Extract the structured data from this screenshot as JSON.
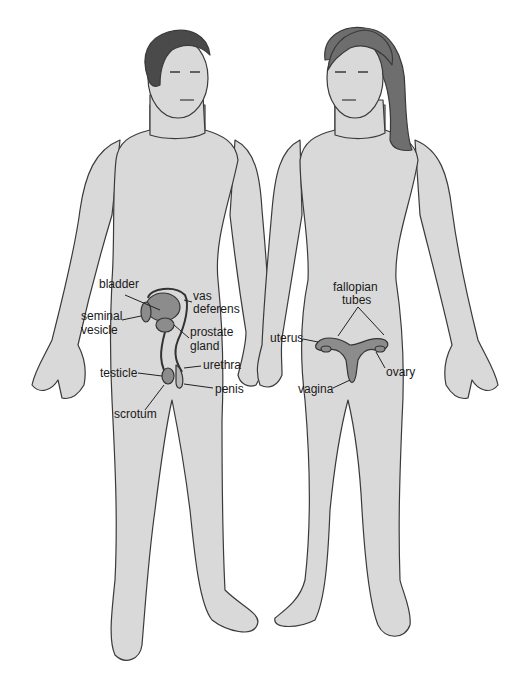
{
  "colors": {
    "skin": "#d9d9d9",
    "outline": "#3a3a3a",
    "hair_male": "#4a4a4a",
    "hair_female": "#6e6e6e",
    "organ": "#8c8c8c",
    "leader": "#222222"
  },
  "figures": {
    "male": {
      "labels": [
        {
          "id": "bladder",
          "text": "bladder",
          "x": 99,
          "y": 284
        },
        {
          "id": "vas-deferens-1",
          "text": "vas",
          "x": 193,
          "y": 294
        },
        {
          "id": "vas-deferens-2",
          "text": "deferens",
          "x": 193,
          "y": 307
        },
        {
          "id": "seminal-vesicle-1",
          "text": "seminal",
          "x": 81,
          "y": 313
        },
        {
          "id": "seminal-vesicle-2",
          "text": "vesicle",
          "x": 81,
          "y": 327
        },
        {
          "id": "prostate-gland-1",
          "text": "prostate",
          "x": 190,
          "y": 328
        },
        {
          "id": "prostate-gland-2",
          "text": "gland",
          "x": 190,
          "y": 342
        },
        {
          "id": "urethra",
          "text": "urethra",
          "x": 203,
          "y": 361
        },
        {
          "id": "testicle",
          "text": "testicle",
          "x": 100,
          "y": 369
        },
        {
          "id": "penis",
          "text": "penis",
          "x": 215,
          "y": 384
        },
        {
          "id": "scrotum",
          "text": "scrotum",
          "x": 114,
          "y": 409
        }
      ]
    },
    "female": {
      "labels": [
        {
          "id": "fallopian-tubes-1",
          "text": "fallopian",
          "x": 333,
          "y": 283
        },
        {
          "id": "fallopian-tubes-2",
          "text": "tubes",
          "x": 342,
          "y": 296
        },
        {
          "id": "uterus",
          "text": "uterus",
          "x": 270,
          "y": 333
        },
        {
          "id": "ovary",
          "text": "ovary",
          "x": 386,
          "y": 368
        },
        {
          "id": "vagina",
          "text": "vagina",
          "x": 298,
          "y": 385
        }
      ]
    }
  }
}
